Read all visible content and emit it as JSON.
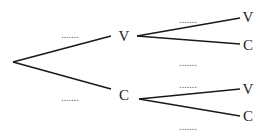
{
  "diagram": {
    "type": "probability-tree",
    "level1": [
      {
        "label": "V",
        "probability_placeholder": "......."
      },
      {
        "label": "C",
        "probability_placeholder": "......."
      }
    ],
    "level2": {
      "from_V": [
        {
          "label": "V",
          "probability_placeholder": "......."
        },
        {
          "label": "C",
          "probability_placeholder": "......."
        }
      ],
      "from_C": [
        {
          "label": "V",
          "probability_placeholder": "......."
        },
        {
          "label": "C",
          "probability_placeholder": "......."
        }
      ]
    }
  }
}
